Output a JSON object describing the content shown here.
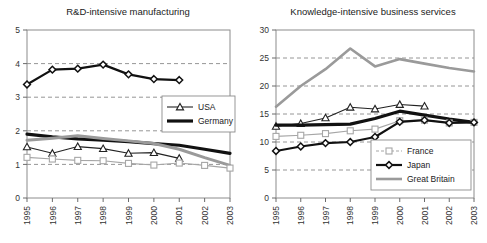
{
  "figure": {
    "panel_count": 2
  },
  "chart_data": [
    {
      "type": "line",
      "panel_id": "rnd-intensive-manufacturing",
      "title": "R&D-intensive manufacturing",
      "xlabel": "",
      "ylabel": "",
      "x": [
        "1995",
        "1996",
        "1997",
        "1998",
        "1999",
        "2000",
        "2001",
        "2002",
        "2003"
      ],
      "xlim": [
        0,
        8
      ],
      "ylim": [
        0,
        5
      ],
      "yticks": [
        0,
        1,
        2,
        3,
        4,
        5
      ],
      "grid": "horizontal-dashed",
      "legend_position": "center-right",
      "legend_entries": [
        "USA",
        "Germany"
      ],
      "series": [
        {
          "name": "Japan",
          "marker": "diamond",
          "color": "#111111",
          "line_width": 2.2,
          "in_legend": false,
          "values": [
            3.38,
            3.82,
            3.85,
            3.97,
            3.68,
            3.54,
            3.51,
            null,
            null
          ]
        },
        {
          "name": "Germany",
          "marker": "none",
          "color": "#111111",
          "line_width": 3.2,
          "in_legend": true,
          "values": [
            1.9,
            1.82,
            1.76,
            1.72,
            1.68,
            1.62,
            1.57,
            1.45,
            1.33
          ]
        },
        {
          "name": "Great Britain",
          "marker": "none",
          "color": "#9a9a9a",
          "line_width": 3.0,
          "in_legend": false,
          "values": [
            1.72,
            1.78,
            1.85,
            1.77,
            1.7,
            1.62,
            1.45,
            1.2,
            0.97
          ]
        },
        {
          "name": "USA",
          "marker": "triangle",
          "color": "#222222",
          "line_width": 1.1,
          "in_legend": true,
          "values": [
            1.52,
            1.33,
            1.53,
            1.47,
            1.33,
            1.35,
            1.18,
            null,
            null
          ]
        },
        {
          "name": "France",
          "marker": "square",
          "color": "#a6a6a6",
          "line_width": 1.1,
          "in_legend": false,
          "values": [
            1.21,
            1.16,
            1.12,
            1.11,
            1.03,
            0.98,
            1.04,
            0.97,
            0.89
          ]
        }
      ]
    },
    {
      "type": "line",
      "panel_id": "knowledge-intensive-business-services",
      "title": "Knowledge-intensive business services",
      "xlabel": "",
      "ylabel": "",
      "x": [
        "1995",
        "1996",
        "1997",
        "1998",
        "1999",
        "2000",
        "2001",
        "2002",
        "2003"
      ],
      "xlim": [
        0,
        8
      ],
      "ylim": [
        0,
        30
      ],
      "yticks": [
        0,
        5,
        10,
        15,
        20,
        25,
        30
      ],
      "grid": "horizontal-dashed",
      "legend_position": "bottom-right",
      "legend_entries": [
        "France",
        "Japan",
        "Great Britain"
      ],
      "series": [
        {
          "name": "Great Britain",
          "marker": "none",
          "color": "#9a9a9a",
          "line_width": 2.6,
          "in_legend": true,
          "values": [
            16.3,
            20.0,
            23.0,
            26.7,
            23.5,
            24.8,
            24.0,
            23.2,
            22.6
          ]
        },
        {
          "name": "USA",
          "marker": "triangle",
          "color": "#222222",
          "line_width": 1.1,
          "in_legend": false,
          "values": [
            12.8,
            13.3,
            14.3,
            16.2,
            15.9,
            16.7,
            16.4,
            null,
            null
          ]
        },
        {
          "name": "Germany",
          "marker": "none",
          "color": "#111111",
          "line_width": 3.2,
          "in_legend": false,
          "values": [
            13.0,
            13.0,
            13.1,
            13.2,
            14.2,
            15.5,
            14.8,
            14.1,
            13.5
          ]
        },
        {
          "name": "France",
          "marker": "square",
          "color": "#a6a6a6",
          "line_width": 1.1,
          "in_legend": true,
          "values": [
            11.0,
            11.2,
            11.5,
            12.0,
            12.3,
            13.8,
            13.9,
            13.4,
            13.5
          ]
        },
        {
          "name": "Japan",
          "marker": "diamond",
          "color": "#111111",
          "line_width": 2.2,
          "in_legend": true,
          "values": [
            8.4,
            9.2,
            9.8,
            10.0,
            10.9,
            13.6,
            13.9,
            13.4,
            13.5
          ]
        }
      ]
    }
  ]
}
